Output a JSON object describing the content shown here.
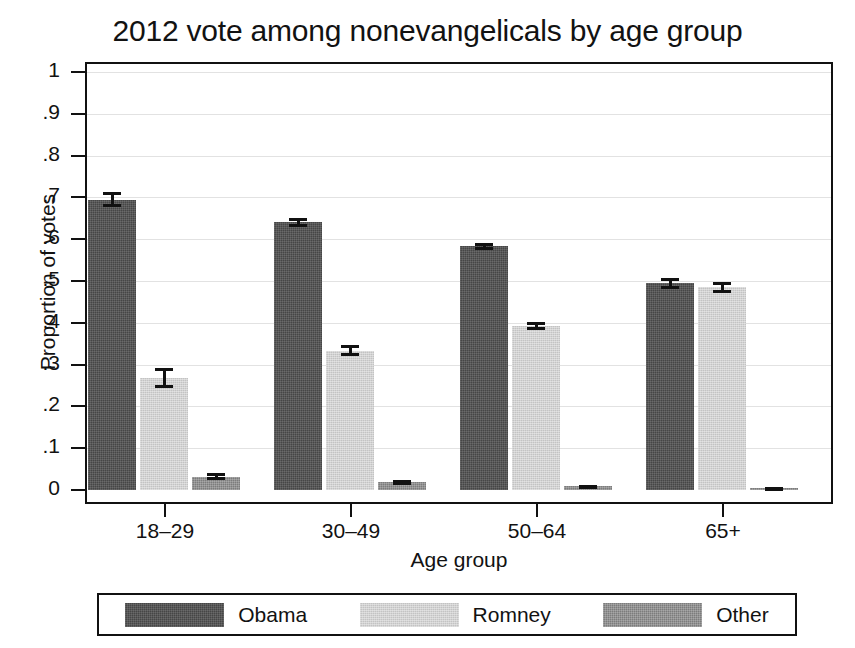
{
  "chart_data": {
    "type": "bar",
    "title": "2012 vote among nonevangelicals by age group",
    "xlabel": "Age group",
    "ylabel": "Proportion of votes",
    "categories": [
      "18–29",
      "30–49",
      "50–64",
      "65+"
    ],
    "ylim": [
      0,
      1
    ],
    "yticks": [
      0,
      0.1,
      0.2,
      0.3,
      0.4,
      0.5,
      0.6,
      0.7,
      0.8,
      0.9,
      1
    ],
    "ytick_labels": [
      "0",
      ".1",
      ".2",
      ".3",
      ".4",
      ".5",
      ".6",
      ".7",
      ".8",
      ".9",
      "1"
    ],
    "grid": true,
    "legend_position": "bottom",
    "series": [
      {
        "name": "Obama",
        "color": "#464646",
        "values": [
          0.695,
          0.64,
          0.583,
          0.495
        ],
        "errors": [
          0.018,
          0.011,
          0.009,
          0.013
        ]
      },
      {
        "name": "Romney",
        "color": "#c3c3c3",
        "values": [
          0.268,
          0.333,
          0.392,
          0.485
        ],
        "errors": [
          0.025,
          0.013,
          0.009,
          0.013
        ]
      },
      {
        "name": "Other",
        "color": "#7c7c7c",
        "values": [
          0.032,
          0.018,
          0.009,
          0.005
        ],
        "errors": [
          0.008,
          0.005,
          0.003,
          0.002
        ]
      }
    ]
  },
  "legend": {
    "items": [
      {
        "label": "Obama",
        "swatch": "obama-swatch"
      },
      {
        "label": "Romney",
        "swatch": "romney-swatch"
      },
      {
        "label": "Other",
        "swatch": "other-swatch"
      }
    ]
  }
}
